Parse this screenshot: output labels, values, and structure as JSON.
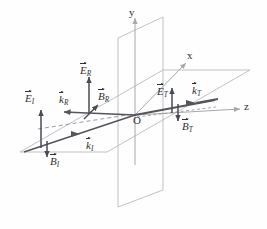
{
  "figure": {
    "type": "3d-vector-diagram",
    "colors": {
      "axis": "#a8a8ac",
      "plane_edge": "#b3b3b7",
      "vector": "#4a4a52",
      "ray": "#55555d",
      "dashed": "#9a9aa0",
      "text": "#2f2f33",
      "background": "#fefefe"
    }
  },
  "axes": {
    "y": {
      "label": "y",
      "origin_label": "O"
    },
    "x": {
      "label": "x"
    },
    "z": {
      "label": "z"
    }
  },
  "origin": {
    "label": "O"
  },
  "planes": [
    {
      "name": "interface-plane",
      "orientation": "x-y vertical plane at z=0"
    },
    {
      "name": "incidence-plane",
      "orientation": "z-x horizontal plane at y=0"
    }
  ],
  "waves": [
    {
      "name": "incident",
      "subscript": "I",
      "efield": {
        "symbol": "E",
        "sub": "I",
        "direction": "up"
      },
      "bfield": {
        "symbol": "B",
        "sub": "I",
        "direction": "down"
      },
      "kvector": {
        "symbol": "k",
        "sub": "I",
        "direction": "toward-origin-up-right"
      }
    },
    {
      "name": "reflected",
      "subscript": "R",
      "efield": {
        "symbol": "E",
        "sub": "R",
        "direction": "up"
      },
      "bfield": {
        "symbol": "B",
        "sub": "R",
        "direction": "up-right"
      },
      "kvector": {
        "symbol": "k",
        "sub": "R",
        "direction": "left"
      }
    },
    {
      "name": "transmitted",
      "subscript": "T",
      "efield": {
        "symbol": "E",
        "sub": "T",
        "direction": "up"
      },
      "bfield": {
        "symbol": "B",
        "sub": "T",
        "direction": "down"
      },
      "kvector": {
        "symbol": "k",
        "sub": "T",
        "direction": "right"
      }
    }
  ],
  "labels": {
    "E_I": {
      "symbol": "E",
      "sub": "I"
    },
    "B_I": {
      "symbol": "B",
      "sub": "I"
    },
    "k_I": {
      "symbol": "k",
      "sub": "I"
    },
    "E_R": {
      "symbol": "E",
      "sub": "R"
    },
    "B_R": {
      "symbol": "B",
      "sub": "R"
    },
    "k_R": {
      "symbol": "k",
      "sub": "R"
    },
    "E_T": {
      "symbol": "E",
      "sub": "T"
    },
    "B_T": {
      "symbol": "B",
      "sub": "T"
    },
    "k_T": {
      "symbol": "k",
      "sub": "T"
    }
  }
}
